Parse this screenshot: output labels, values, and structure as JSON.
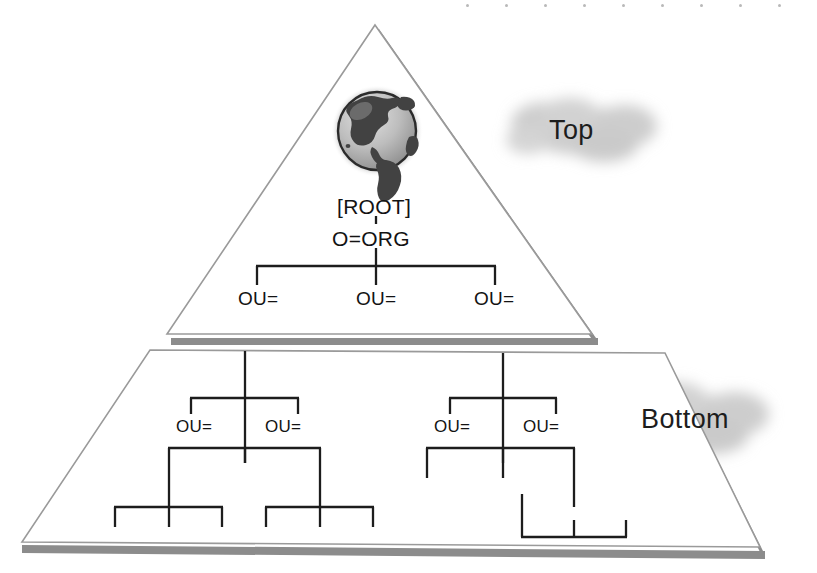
{
  "diagram": {
    "background_color": "#ffffff",
    "line_color": "#1d1d1d",
    "shape_outline_color": "#9a9a9a",
    "shadow_color": "#8a8a8a",
    "cloud_color": "#cfcfcf",
    "text_color": "#131313"
  },
  "top_section": {
    "cloud_label": "Top",
    "globe_icon": "globe-earth-icon",
    "root_label": "[ROOT]",
    "org_label": "O=ORG",
    "ou_labels": [
      "OU=",
      "OU=",
      "OU="
    ]
  },
  "bottom_section": {
    "cloud_label": "Bottom",
    "left_tree_ou_labels": [
      "OU=",
      "OU="
    ],
    "right_tree_ou_labels": [
      "OU=",
      "OU="
    ]
  },
  "decoration": {
    "top_dot_count": 10,
    "dot_start_x": 466,
    "dot_spacing": 39,
    "dot_y": 4
  }
}
